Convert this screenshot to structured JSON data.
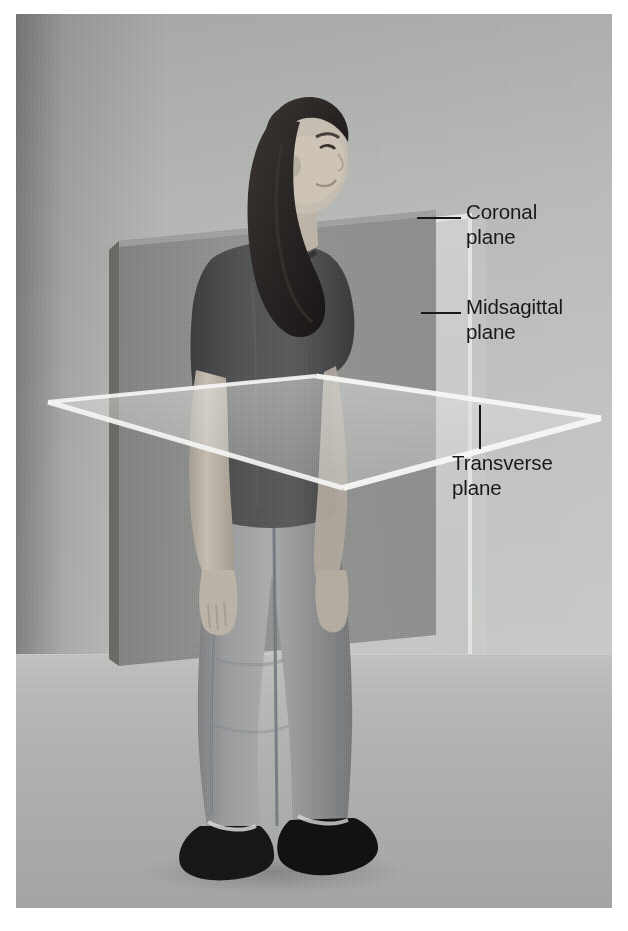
{
  "figure": {
    "type": "anatomical-planes-photograph",
    "medium": "black-and-white photograph with illustrated translucent planes",
    "subject_description": "Woman standing in anatomical position, facing right, wearing dark short-sleeve t-shirt and light blue denim jeans with dark shoes",
    "background_description": "Neutral grey studio backdrop with floor"
  },
  "labels": {
    "coronal": "Coronal\nplane",
    "midsagittal": "Midsagittal\nplane",
    "transverse": "Transverse\nplane"
  },
  "label_names": {
    "coronal": "Coronal plane",
    "midsagittal": "Midsagittal plane",
    "transverse": "Transverse plane"
  },
  "planes": [
    {
      "id": "coronal",
      "name": "Coronal plane",
      "orientation": "frontal vertical plane, divides body into anterior and posterior",
      "appearance": "opaque medium-grey rectangular slab seen edge-on at slight angle"
    },
    {
      "id": "midsagittal",
      "name": "Midsagittal plane",
      "orientation": "vertical plane through midline, divides body into left and right halves",
      "appearance": "pale translucent vertical panel"
    },
    {
      "id": "transverse",
      "name": "Transverse plane",
      "orientation": "horizontal plane, divides body into superior and inferior",
      "appearance": "translucent horizontal sheet drawn as a flat diamond with bright white edges"
    }
  ],
  "colors": {
    "photo_background": "#bcbebc",
    "floor": "#b2b4b2",
    "coronal_plane": "#8d8f8d",
    "coronal_plane_edge": "#6e706e",
    "midsagittal_plane": "#cdcfcd",
    "transverse_plane": "#c9cbc9",
    "plane_highlight": "#f2f3f1",
    "label_text": "#19191b",
    "leader_line": "#19191b",
    "page": "#ffffff",
    "shirt": "#4b4c4d",
    "jeans": "#9a9c9d",
    "hair": "#2a2727",
    "shoes": "#171718",
    "skin": "#c3bbb0"
  }
}
